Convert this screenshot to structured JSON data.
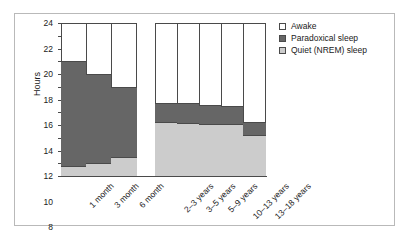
{
  "chart_data": {
    "type": "bar",
    "title": "",
    "xlabel": "",
    "ylabel": "Hours",
    "ylim": [
      0,
      24
    ],
    "ytick_step": 2,
    "yticks": [
      24,
      22,
      20,
      18,
      16,
      14,
      12,
      10,
      8,
      6,
      4,
      2,
      0
    ],
    "grid": false,
    "stacked": true,
    "legend_position": "right-top",
    "categories": [
      "1 month",
      "3 month",
      "6 month",
      "2–3 years",
      "3–5 years",
      "5–9 years",
      "10–13 years",
      "13–18 years"
    ],
    "groups": [
      {
        "name": "infants",
        "categories": [
          "1 month",
          "3 month",
          "6 month"
        ]
      },
      {
        "name": "children",
        "categories": [
          "2–3 years",
          "3–5 years",
          "5–9 years",
          "10–13 years",
          "13–18 years"
        ]
      }
    ],
    "series": [
      {
        "name": "Quiet (NREM) sleep",
        "color": "#cccccc",
        "values": [
          1.5,
          2.0,
          3.0,
          8.4,
          8.3,
          8.2,
          8.1,
          6.4
        ]
      },
      {
        "name": "Paradoxical sleep",
        "color": "#666666",
        "values": [
          16.5,
          14.0,
          11.0,
          3.1,
          3.1,
          3.0,
          2.9,
          2.1
        ]
      },
      {
        "name": "Awake",
        "color": "#ffffff",
        "values": [
          6.0,
          8.0,
          10.0,
          12.5,
          12.6,
          12.8,
          13.0,
          15.5
        ]
      }
    ],
    "totals_sleep": [
      18.0,
      16.0,
      14.0,
      11.5,
      11.4,
      11.2,
      11.0,
      8.5
    ]
  },
  "legend": {
    "items": [
      {
        "label": "Awake",
        "swatch": "awake-swatch"
      },
      {
        "label": "Paradoxical sleep",
        "swatch": "paradoxical-swatch"
      },
      {
        "label": "Quiet (NREM) sleep",
        "swatch": "nrem-swatch"
      }
    ]
  },
  "axis": {
    "y_title": "Hours"
  }
}
